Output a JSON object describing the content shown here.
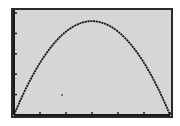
{
  "chart_data": {
    "type": "line",
    "title": "",
    "xlabel": "",
    "ylabel": "",
    "xlim": [
      0,
      6
    ],
    "ylim": [
      0,
      5
    ],
    "x_tick_step": 1,
    "y_tick_step": 1,
    "grid": false,
    "axes": "x-axis along bottom edge, y-axis along left edge, tick marks only, no labels",
    "series": [
      {
        "name": "parabola",
        "equation_form": "y = a*x*(6-x)",
        "x": [
          0,
          0.5,
          1,
          1.5,
          2,
          2.5,
          3,
          3.5,
          4,
          4.5,
          5,
          5.5,
          6
        ],
        "y": [
          0,
          1.26,
          2.3,
          3.15,
          3.7,
          4.05,
          4.6,
          4.05,
          3.7,
          3.15,
          2.3,
          1.26,
          0
        ]
      }
    ],
    "vertex": [
      3,
      4.6
    ],
    "roots": [
      0,
      6
    ]
  },
  "colors": {
    "screen_bg": "#d6d6d6",
    "border": "#2a2a2a",
    "curve": "#1a1a1a"
  }
}
